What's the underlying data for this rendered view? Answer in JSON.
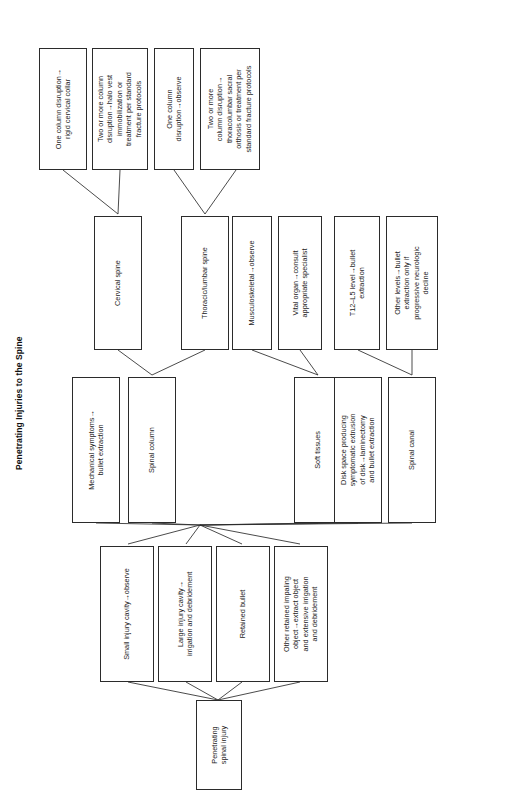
{
  "figure": {
    "title": "Penetrating Injuries to the Spine",
    "orientation": "rotated-90-ccw",
    "type": "flowchart"
  },
  "nodes": {
    "root": {
      "label": "Penetrating\nspinal injury"
    },
    "level2": [
      {
        "label": "Small injury cavity→observe"
      },
      {
        "label": "Large injury cavity→\nirrigation and debridement"
      },
      {
        "label": "Retained bullet"
      },
      {
        "label": "Other retained impaling\nobject→extract object\nand extensive irrigation\nand debridement"
      }
    ],
    "level3": [
      {
        "label": "Mechanical symptoms→\nbullet extraction"
      },
      {
        "label": "Spinal column"
      },
      {
        "label": "Soft tissues"
      },
      {
        "label": "Disk space producing\nsymptomatic extrusion\nof disk→laminectomy\nand bullet extraction"
      },
      {
        "label": "Spinal canal"
      }
    ],
    "level4": [
      {
        "label": "Cervical spine"
      },
      {
        "label": "Thoracic/lumbar spine"
      },
      {
        "label": "Musculoskeletal→observe"
      },
      {
        "label": "Vital organ→consult\nappropriate specialist"
      },
      {
        "label": "T12–L5 level→bullet\nextraction"
      },
      {
        "label": "Other levels→bullet\nextraction only if\nprogressive neurologic\ndecline"
      }
    ],
    "level5": [
      {
        "label": "One column disruption→\nrigid cervical collar"
      },
      {
        "label": "Two or more column\ndisruption→halo vest\nimmobilization or\ntreatment per standard\nfracture protocols"
      },
      {
        "label": "One column\ndisruption→observe"
      },
      {
        "label": "Two or more\ncolumn disruption→\nthoracolumbar sacral\northosis or treatment per\nstandard fracture protocols"
      }
    ]
  },
  "colors": {
    "border": "#2b2b2b",
    "background": "#ffffff",
    "text": "#222222"
  }
}
